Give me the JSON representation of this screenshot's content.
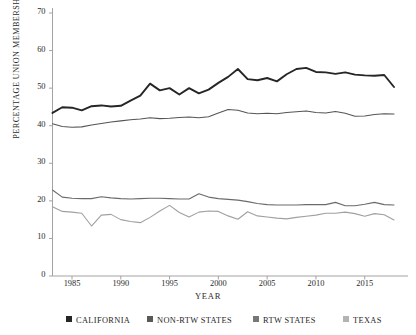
{
  "chart_data": {
    "type": "line",
    "title": "",
    "xlabel": "YEAR",
    "ylabel": "PERCENTAGE UNION MEMBERSHIP",
    "xlim": [
      1983,
      2018
    ],
    "ylim": [
      0,
      70
    ],
    "grid": false,
    "legend_position": "bottom",
    "yticks": [
      0,
      10,
      20,
      30,
      40,
      50,
      60,
      70
    ],
    "xticks": [
      1985,
      1990,
      1995,
      2000,
      2005,
      2010,
      2015
    ],
    "x": [
      1983,
      1984,
      1985,
      1986,
      1987,
      1988,
      1989,
      1990,
      1991,
      1992,
      1993,
      1994,
      1995,
      1996,
      1997,
      1998,
      1999,
      2000,
      2001,
      2002,
      2003,
      2004,
      2005,
      2006,
      2007,
      2008,
      2009,
      2010,
      2011,
      2012,
      2013,
      2014,
      2015,
      2016,
      2017,
      2018
    ],
    "series": [
      {
        "name": "CALIFORNIA",
        "color": "#262626",
        "width": 1.9,
        "values": [
          43.4,
          44.9,
          44.8,
          44.1,
          45.2,
          45.4,
          45.1,
          45.3,
          46.7,
          48.0,
          51.2,
          49.4,
          50.0,
          48.3,
          50.0,
          48.6,
          49.6,
          51.4,
          53.0,
          55.1,
          52.4,
          52.1,
          52.7,
          51.8,
          53.7,
          55.1,
          55.4,
          54.3,
          54.2,
          53.8,
          54.2,
          53.6,
          53.4,
          53.3,
          53.5,
          50.3
        ]
      },
      {
        "name": "NON-RTW STATES",
        "color": "#555555",
        "width": 1.1,
        "values": [
          40.5,
          39.8,
          39.6,
          39.7,
          40.2,
          40.6,
          41.0,
          41.3,
          41.6,
          41.8,
          42.1,
          41.9,
          42.0,
          42.2,
          42.3,
          42.1,
          42.4,
          43.4,
          44.3,
          44.1,
          43.4,
          43.2,
          43.3,
          43.2,
          43.5,
          43.7,
          43.9,
          43.5,
          43.4,
          43.8,
          43.3,
          42.5,
          42.6,
          43.0,
          43.2,
          43.1
        ]
      },
      {
        "name": "RTW STATES",
        "color": "#6b6b6b",
        "width": 1.1,
        "values": [
          22.9,
          21.0,
          20.7,
          20.6,
          20.6,
          21.1,
          20.8,
          20.6,
          20.5,
          20.6,
          20.7,
          20.7,
          20.6,
          20.5,
          20.5,
          21.9,
          21.0,
          20.6,
          20.4,
          20.2,
          19.8,
          19.3,
          19.0,
          18.9,
          18.9,
          18.9,
          19.0,
          19.0,
          19.0,
          19.6,
          18.7,
          18.7,
          19.1,
          19.6,
          19.0,
          18.9
        ]
      },
      {
        "name": "TEXAS",
        "color": "#a0a0a0",
        "width": 1.1,
        "values": [
          18.4,
          17.2,
          17.0,
          16.7,
          13.3,
          16.2,
          16.4,
          15.0,
          14.5,
          14.2,
          15.6,
          17.3,
          18.8,
          16.9,
          15.7,
          17.0,
          17.3,
          17.2,
          16.0,
          15.1,
          17.1,
          16.0,
          15.7,
          15.4,
          15.2,
          15.6,
          15.9,
          16.2,
          16.7,
          16.7,
          17.0,
          16.6,
          15.9,
          16.6,
          16.3,
          14.9
        ]
      }
    ]
  },
  "legend": {
    "items": [
      {
        "label": "CALIFORNIA",
        "color": "#262626"
      },
      {
        "label": "NON-RTW STATES",
        "color": "#595959"
      },
      {
        "label": "RTW STATES",
        "color": "#777777"
      },
      {
        "label": "TEXAS",
        "color": "#b3b3b3"
      }
    ]
  }
}
